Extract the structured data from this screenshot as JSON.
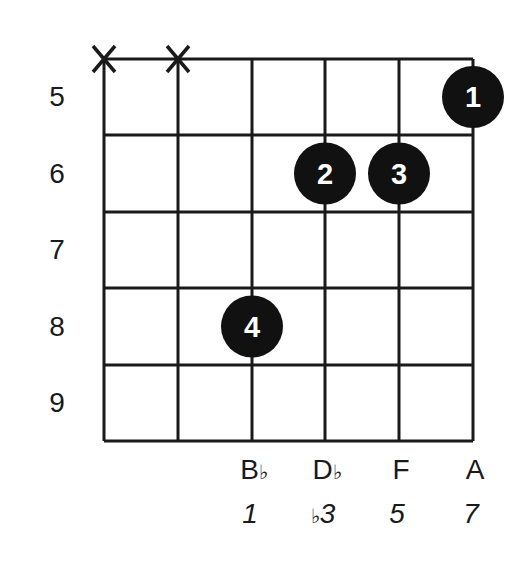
{
  "diagram": {
    "type": "chord-diagram",
    "strings": 6,
    "frets": [
      5,
      6,
      7,
      8,
      9
    ],
    "muted_strings": [
      1,
      2
    ],
    "muted_symbol": "X",
    "fingers": [
      {
        "finger": "1",
        "string": 6,
        "fret": 5
      },
      {
        "finger": "2",
        "string": 4,
        "fret": 6
      },
      {
        "finger": "3",
        "string": 5,
        "fret": 6
      },
      {
        "finger": "4",
        "string": 3,
        "fret": 8
      }
    ],
    "notes": [
      {
        "string": 3,
        "name": "B",
        "accidental": "♭"
      },
      {
        "string": 4,
        "name": "D",
        "accidental": "♭"
      },
      {
        "string": 5,
        "name": "F",
        "accidental": ""
      },
      {
        "string": 6,
        "name": "A",
        "accidental": ""
      }
    ],
    "intervals": [
      {
        "string": 3,
        "prefix": "",
        "degree": "1"
      },
      {
        "string": 4,
        "prefix": "♭",
        "degree": "3"
      },
      {
        "string": 5,
        "prefix": "",
        "degree": "5"
      },
      {
        "string": 6,
        "prefix": "",
        "degree": "7"
      }
    ],
    "colors": {
      "line": "#1a1a1a",
      "dot": "#111111",
      "dot_text": "#ffffff"
    }
  }
}
